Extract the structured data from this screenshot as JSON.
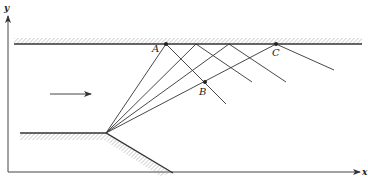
{
  "diagram": {
    "axes": {
      "x_label": "x",
      "y_label": "y"
    },
    "points": {
      "A": {
        "label": "A"
      },
      "B": {
        "label": "B"
      },
      "C": {
        "label": "C"
      }
    },
    "flow_arrow": "uniform-flow-direction",
    "colors": {
      "line": "#333333",
      "hatch": "#888888",
      "background": "#ffffff"
    }
  }
}
